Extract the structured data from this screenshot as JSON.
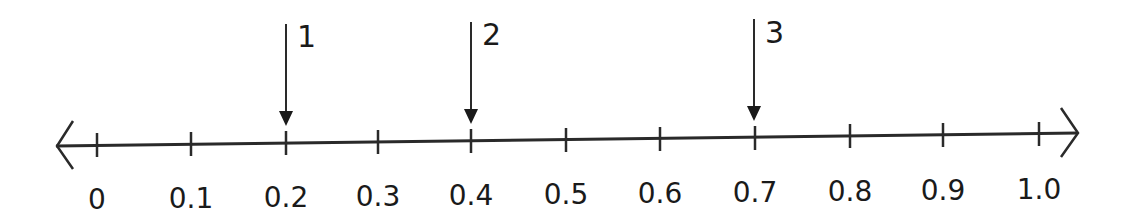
{
  "diagram": {
    "type": "number-line",
    "range": [
      0,
      1.0
    ],
    "step": 0.1,
    "tick_labels": [
      "0",
      "0.1",
      "0.2",
      "0.3",
      "0.4",
      "0.5",
      "0.6",
      "0.7",
      "0.8",
      "0.9",
      "1.0"
    ],
    "arrows": [
      {
        "label": "1",
        "points_to": "0.2"
      },
      {
        "label": "2",
        "points_to": "0.4"
      },
      {
        "label": "3",
        "points_to": "0.7"
      }
    ],
    "colors": {
      "line": "#2a2a2a",
      "text": "#1a1a1a",
      "background": "#ffffff"
    }
  }
}
